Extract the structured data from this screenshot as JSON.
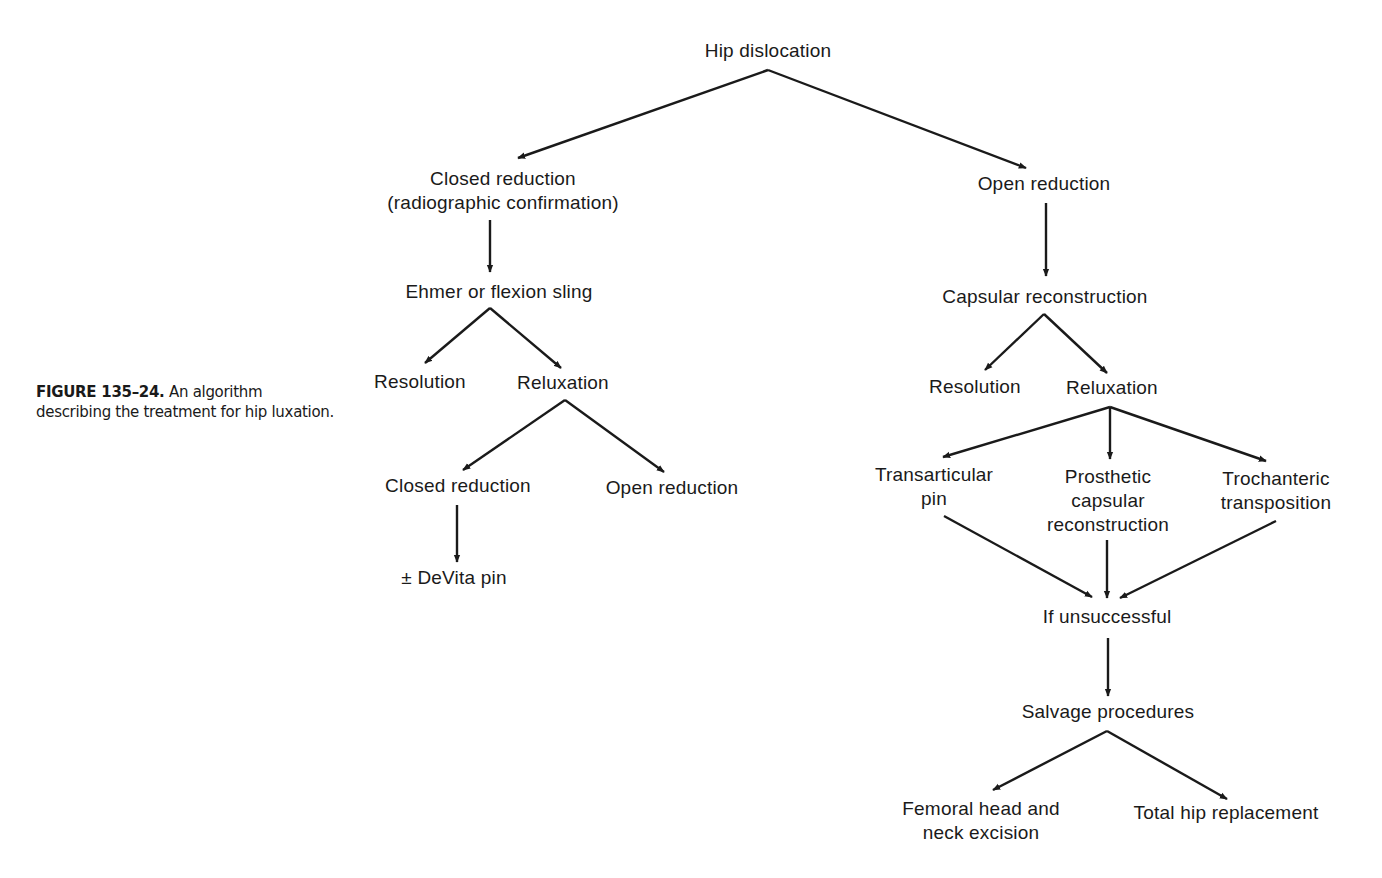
{
  "caption": {
    "figure_label": "FIGURE 135–24.",
    "text": " An algorithm describing the treatment for hip luxation."
  },
  "nodes": {
    "root": "Hip dislocation",
    "closed_reduction": [
      "Closed reduction",
      "(radiographic confirmation)"
    ],
    "ehmer_sling": "Ehmer or flexion sling",
    "left_resolution": "Resolution",
    "left_reluxation": "Reluxation",
    "left_closed_reduction": "Closed reduction",
    "left_open_reduction": "Open reduction",
    "devita_pin": "± DeVita pin",
    "open_reduction": "Open reduction",
    "capsular_reconstruction": "Capsular reconstruction",
    "right_resolution": "Resolution",
    "right_reluxation": "Reluxation",
    "transarticular_pin": [
      "Transarticular",
      "pin"
    ],
    "prosthetic_capsular": [
      "Prosthetic",
      "capsular",
      "reconstruction"
    ],
    "trochanteric_transposition": [
      "Trochanteric",
      "transposition"
    ],
    "if_unsuccessful": "If unsuccessful",
    "salvage_procedures": "Salvage procedures",
    "femoral_head_excision": [
      "Femoral head and",
      "neck excision"
    ],
    "total_hip_replacement": "Total hip replacement"
  },
  "edges": [
    [
      "root",
      "closed_reduction"
    ],
    [
      "root",
      "open_reduction"
    ],
    [
      "closed_reduction",
      "ehmer_sling"
    ],
    [
      "ehmer_sling",
      "left_resolution"
    ],
    [
      "ehmer_sling",
      "left_reluxation"
    ],
    [
      "left_reluxation",
      "left_closed_reduction"
    ],
    [
      "left_reluxation",
      "left_open_reduction"
    ],
    [
      "left_closed_reduction",
      "devita_pin"
    ],
    [
      "open_reduction",
      "capsular_reconstruction"
    ],
    [
      "capsular_reconstruction",
      "right_resolution"
    ],
    [
      "capsular_reconstruction",
      "right_reluxation"
    ],
    [
      "right_reluxation",
      "transarticular_pin"
    ],
    [
      "right_reluxation",
      "prosthetic_capsular"
    ],
    [
      "right_reluxation",
      "trochanteric_transposition"
    ],
    [
      "transarticular_pin",
      "if_unsuccessful"
    ],
    [
      "prosthetic_capsular",
      "if_unsuccessful"
    ],
    [
      "trochanteric_transposition",
      "if_unsuccessful"
    ],
    [
      "if_unsuccessful",
      "salvage_procedures"
    ],
    [
      "salvage_procedures",
      "femoral_head_excision"
    ],
    [
      "salvage_procedures",
      "total_hip_replacement"
    ]
  ]
}
